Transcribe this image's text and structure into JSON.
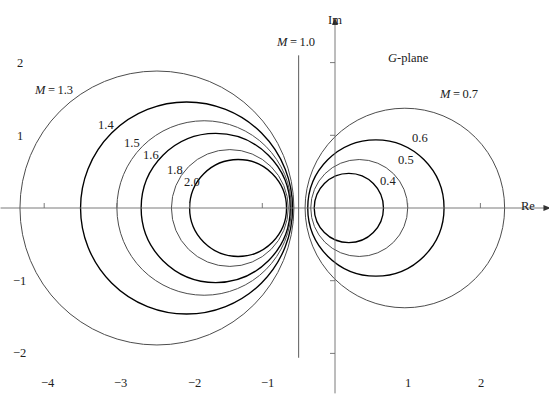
{
  "figure": {
    "plane_label_italic": "G",
    "plane_label_rest": "-plane",
    "axis_im_label": "Im",
    "axis_re_label": "Re"
  },
  "axes": {
    "x_tick_labels": [
      "−4",
      "−3",
      "−2",
      "−1",
      "1",
      "2"
    ],
    "x_tick_values": [
      -4,
      -3,
      -2,
      -1,
      1,
      2
    ],
    "y_tick_labels": [
      "2",
      "1",
      "−1",
      "−2"
    ],
    "y_tick_values": [
      2,
      1,
      -1,
      -2
    ],
    "x_range": [
      -4.6,
      2.95
    ],
    "y_range": [
      -2.55,
      2.6
    ],
    "origin_px": [
      335,
      208
    ],
    "px_per_unit": 72.7,
    "grid": false
  },
  "chart_data": {
    "type": "line",
    "subtitle": "",
    "xlabel": "Re",
    "ylabel": "Im",
    "xlim": [
      -4.6,
      2.95
    ],
    "ylim": [
      -2.55,
      2.6
    ],
    "legend": "inline-curve-labels",
    "annotations": [
      {
        "text": "M = 1.3",
        "x": -4.1,
        "y": 1.62
      },
      {
        "text": "1.4",
        "x": -3.18,
        "y": 1.14
      },
      {
        "text": "1.5",
        "x": -2.82,
        "y": 0.89
      },
      {
        "text": "1.6",
        "x": -2.57,
        "y": 0.73
      },
      {
        "text": "1.8",
        "x": -2.24,
        "y": 0.52
      },
      {
        "text": "2.0",
        "x": -2.02,
        "y": 0.36
      },
      {
        "text": "M = 1.0",
        "x": -0.78,
        "y": 2.13
      },
      {
        "text": "G-plane",
        "x": 0.73,
        "y": 2.13
      },
      {
        "text": "M = 0.7",
        "x": 1.44,
        "y": 1.59
      },
      {
        "text": "0.6",
        "x": 1.09,
        "y": 0.98
      },
      {
        "text": "0.5",
        "x": 0.9,
        "y": 0.68
      },
      {
        "text": "0.4",
        "x": 0.66,
        "y": 0.39
      }
    ],
    "note": "Each M-circle has center (-M^2/(M^2-1), 0) and radius M/|M^2-1|.",
    "series": [
      {
        "name": "M = 1.3",
        "M": 1.3,
        "center_x": -2.4493,
        "center_y": 0,
        "radius": 1.8841,
        "color": "#4d4d4d",
        "stroke_width": 1.0
      },
      {
        "name": "M = 1.4",
        "M": 1.4,
        "center_x": -2.0417,
        "center_y": 0,
        "radius": 1.4583,
        "color": "#000000",
        "stroke_width": 1.35
      },
      {
        "name": "M = 1.5",
        "M": 1.5,
        "center_x": -1.8,
        "center_y": 0,
        "radius": 1.2,
        "color": "#4d4d4d",
        "stroke_width": 1.0
      },
      {
        "name": "M = 1.6",
        "M": 1.6,
        "center_x": -1.641,
        "center_y": 0,
        "radius": 1.0256,
        "color": "#000000",
        "stroke_width": 1.35
      },
      {
        "name": "M = 1.8",
        "M": 1.8,
        "center_x": -1.4464,
        "center_y": 0,
        "radius": 0.8036,
        "color": "#4d4d4d",
        "stroke_width": 1.0
      },
      {
        "name": "M = 2.0",
        "M": 2.0,
        "center_x": -1.3333,
        "center_y": 0,
        "radius": 0.6667,
        "color": "#000000",
        "stroke_width": 1.35
      },
      {
        "name": "M = 1.0",
        "M": 1.0,
        "center_x": null,
        "center_y": null,
        "radius": null,
        "type": "vertical-line",
        "line_x": -0.5,
        "color": "#5a5a5a",
        "stroke_width": 1.0
      },
      {
        "name": "M = 0.7",
        "M": 0.7,
        "center_x": 0.9608,
        "center_y": 0,
        "radius": 1.3725,
        "color": "#4d4d4d",
        "stroke_width": 1.0
      },
      {
        "name": "M = 0.6",
        "M": 0.6,
        "center_x": 0.5625,
        "center_y": 0,
        "radius": 0.9375,
        "color": "#000000",
        "stroke_width": 1.35
      },
      {
        "name": "M = 0.5",
        "M": 0.5,
        "center_x": 0.3333,
        "center_y": 0,
        "radius": 0.6667,
        "color": "#4d4d4d",
        "stroke_width": 1.0
      },
      {
        "name": "M = 0.4",
        "M": 0.4,
        "center_x": 0.1905,
        "center_y": 0,
        "radius": 0.4762,
        "color": "#000000",
        "stroke_width": 1.35
      }
    ]
  }
}
